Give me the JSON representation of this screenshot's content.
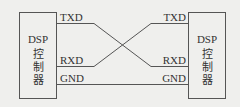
{
  "diagram": {
    "left_device": {
      "lines": [
        "DSP",
        "控",
        "制",
        "器"
      ]
    },
    "right_device": {
      "lines": [
        "DSP",
        "控",
        "制",
        "器"
      ]
    },
    "signals": {
      "txd": "TXD",
      "rxd": "RXD",
      "gnd": "GND"
    },
    "line_color": "#555555",
    "background": "#efefed"
  }
}
